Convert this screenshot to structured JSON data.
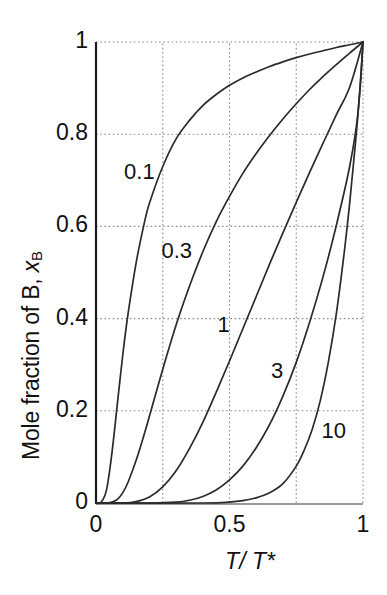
{
  "chart_data": {
    "type": "line",
    "title": "",
    "subtitle": "",
    "xlabel": "T/ T*",
    "xlabel_parts": {
      "numerator": "T",
      "separator": "/ ",
      "denominator": "T*"
    },
    "ylabel": "Mole fraction of B, x_B",
    "ylabel_parts": {
      "text": "Mole fraction of B, ",
      "variable": "x",
      "subscript": "B"
    },
    "xlim": [
      0,
      1
    ],
    "ylim": [
      0,
      1
    ],
    "xticks": [
      0,
      0.5,
      1
    ],
    "xtick_labels": [
      "0",
      "0.5",
      "1"
    ],
    "yticks": [
      0,
      0.2,
      0.4,
      0.6,
      0.8,
      1
    ],
    "ytick_labels": [
      "0",
      "0.2",
      "0.4",
      "0.6",
      "0.8",
      "1"
    ],
    "grid": true,
    "grid_style": "dotted",
    "grid_x": [
      0.25,
      0.5,
      0.75,
      1.0
    ],
    "grid_y": [
      0.2,
      0.4,
      0.6,
      0.8,
      1.0
    ],
    "legend": "inline-curve-labels",
    "legend_position": "inline",
    "series": [
      {
        "name": "0.1",
        "label": "0.1",
        "label_x": 0.105,
        "label_y": 0.715,
        "parameter": 0.1,
        "x": [
          0.0,
          0.02,
          0.04,
          0.06,
          0.08,
          0.1,
          0.12,
          0.15,
          0.18,
          0.2,
          0.25,
          0.3,
          0.35,
          0.4,
          0.45,
          0.5,
          0.55,
          0.6,
          0.65,
          0.7,
          0.75,
          0.8,
          0.85,
          0.9,
          0.95,
          1.0
        ],
        "y": [
          0.0,
          0.002,
          0.03,
          0.11,
          0.215,
          0.32,
          0.41,
          0.52,
          0.605,
          0.65,
          0.73,
          0.79,
          0.83,
          0.862,
          0.886,
          0.906,
          0.922,
          0.935,
          0.947,
          0.957,
          0.966,
          0.974,
          0.981,
          0.988,
          0.994,
          1.0
        ]
      },
      {
        "name": "0.3",
        "label": "0.3",
        "label_x": 0.245,
        "label_y": 0.545,
        "parameter": 0.3,
        "x": [
          0.0,
          0.04,
          0.06,
          0.08,
          0.1,
          0.12,
          0.15,
          0.18,
          0.2,
          0.25,
          0.3,
          0.35,
          0.4,
          0.45,
          0.5,
          0.55,
          0.6,
          0.65,
          0.7,
          0.75,
          0.8,
          0.85,
          0.9,
          0.95,
          1.0
        ],
        "y": [
          0.0,
          0.0,
          0.002,
          0.008,
          0.022,
          0.045,
          0.092,
          0.148,
          0.188,
          0.29,
          0.386,
          0.47,
          0.545,
          0.61,
          0.665,
          0.715,
          0.758,
          0.797,
          0.833,
          0.866,
          0.897,
          0.925,
          0.951,
          0.976,
          1.0
        ]
      },
      {
        "name": "1",
        "label": "1",
        "label_x": 0.455,
        "label_y": 0.385,
        "parameter": 1,
        "x": [
          0.0,
          0.1,
          0.15,
          0.2,
          0.25,
          0.3,
          0.35,
          0.4,
          0.45,
          0.5,
          0.55,
          0.6,
          0.65,
          0.7,
          0.75,
          0.8,
          0.85,
          0.9,
          0.95,
          1.0
        ],
        "y": [
          0.0,
          0.0,
          0.003,
          0.013,
          0.035,
          0.07,
          0.118,
          0.175,
          0.24,
          0.308,
          0.378,
          0.448,
          0.518,
          0.586,
          0.652,
          0.717,
          0.78,
          0.842,
          0.902,
          1.0
        ]
      },
      {
        "name": "3",
        "label": "3",
        "label_x": 0.655,
        "label_y": 0.285,
        "parameter": 3,
        "x": [
          0.0,
          0.2,
          0.3,
          0.35,
          0.4,
          0.45,
          0.5,
          0.55,
          0.6,
          0.65,
          0.7,
          0.75,
          0.8,
          0.85,
          0.9,
          0.95,
          0.98,
          1.0
        ],
        "y": [
          0.0,
          0.0,
          0.002,
          0.006,
          0.014,
          0.028,
          0.05,
          0.08,
          0.12,
          0.17,
          0.232,
          0.305,
          0.392,
          0.49,
          0.602,
          0.73,
          0.84,
          1.0
        ]
      },
      {
        "name": "10",
        "label": "10",
        "label_x": 0.845,
        "label_y": 0.155,
        "parameter": 10,
        "x": [
          0.0,
          0.4,
          0.5,
          0.55,
          0.6,
          0.65,
          0.7,
          0.75,
          0.78,
          0.81,
          0.84,
          0.87,
          0.9,
          0.93,
          0.95,
          0.97,
          0.99,
          1.0
        ],
        "y": [
          0.0,
          0.0,
          0.002,
          0.005,
          0.011,
          0.022,
          0.042,
          0.08,
          0.115,
          0.16,
          0.222,
          0.305,
          0.41,
          0.545,
          0.65,
          0.77,
          0.905,
          1.0
        ]
      }
    ]
  },
  "plot_frame": {
    "left_px": 96,
    "right_px": 363,
    "top_px": 42,
    "bottom_px": 503
  }
}
